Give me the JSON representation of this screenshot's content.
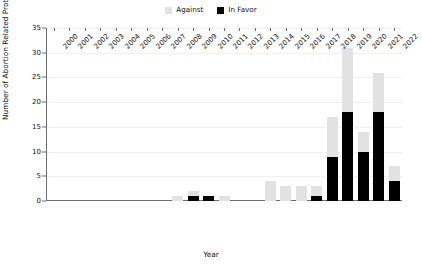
{
  "chart_data": {
    "type": "bar",
    "stacked": true,
    "title": "",
    "xlabel": "Year",
    "ylabel": "Number of Abortion Related Protests",
    "ylim": [
      0,
      35
    ],
    "ytick_step": 5,
    "yticks": [
      0,
      5,
      10,
      15,
      20,
      25,
      30,
      35
    ],
    "grid": true,
    "legend_position": "top-center",
    "categories": [
      "2000",
      "2001",
      "2002",
      "2003",
      "2004",
      "2005",
      "2006",
      "2007",
      "2008",
      "2009",
      "2010",
      "2011",
      "2012",
      "2013",
      "2014",
      "2015",
      "2016",
      "2017",
      "2018",
      "2019",
      "2020",
      "2021",
      "2022"
    ],
    "series": [
      {
        "name": "In Favor",
        "color": "#000000",
        "values": [
          0,
          0,
          0,
          0,
          0,
          0,
          0,
          0,
          0,
          1,
          1,
          0,
          0,
          0,
          0,
          0,
          0,
          1,
          9,
          18,
          10,
          18,
          4
        ]
      },
      {
        "name": "Against",
        "color": "#e2e2e2",
        "values": [
          0,
          0,
          0,
          0,
          0,
          0,
          0,
          0,
          1,
          1,
          0,
          1,
          0,
          0,
          4,
          3,
          3,
          2,
          8,
          13,
          4,
          8,
          3
        ]
      }
    ],
    "totals": [
      0,
      0,
      0,
      0,
      0,
      0,
      0,
      0,
      1,
      2,
      1,
      1,
      0,
      0,
      4,
      3,
      3,
      3,
      17,
      31,
      14,
      26,
      7
    ]
  },
  "legend": {
    "entries": [
      {
        "label": "Against",
        "color": "#e2e2e2"
      },
      {
        "label": "In Favor",
        "color": "#000000"
      }
    ]
  },
  "axes": {
    "x_title": "Year",
    "y_title": "Number of Abortion Related Protests"
  }
}
